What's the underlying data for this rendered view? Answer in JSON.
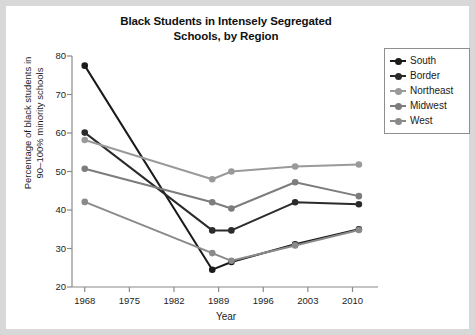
{
  "chart_data": {
    "type": "line",
    "title": "Black Students in Intensely Segregated Schools, by Region",
    "title_line1": "Black Students in Intensely Segregated",
    "title_line2": "Schools, by Region",
    "xlabel": "Year",
    "ylabel": "Percentage of black students in 90–100% minority schools",
    "ylabel_line1": "Percentage of black students in",
    "ylabel_line2": "90–100% minority schools",
    "xlim": [
      1966,
      2014
    ],
    "ylim": [
      20,
      80
    ],
    "yticks": [
      20,
      30,
      40,
      50,
      60,
      70,
      80
    ],
    "ytick_labels": [
      "20",
      "30",
      "40",
      "50",
      "60",
      "70",
      "80"
    ],
    "xticks": [
      1968,
      1975,
      1982,
      1989,
      1996,
      2003,
      2010
    ],
    "xtick_labels": [
      "1968",
      "1975",
      "1982",
      "1989",
      "1996",
      "2003",
      "2010"
    ],
    "grid": false,
    "legend_position": "outside top-right",
    "x": [
      1968,
      1988,
      1991,
      2001,
      2011
    ],
    "series": [
      {
        "name": "South",
        "color": "#1a1a1a",
        "values": [
          77.5,
          24.5,
          26.5,
          31.1,
          35.0
        ]
      },
      {
        "name": "Border",
        "color": "#2b2b2b",
        "values": [
          60.1,
          34.7,
          34.7,
          42.0,
          41.5
        ]
      },
      {
        "name": "Northeast",
        "color": "#9a9a9a",
        "values": [
          58.2,
          48.0,
          50.0,
          51.3,
          51.8
        ]
      },
      {
        "name": "Midwest",
        "color": "#7d7d7d",
        "values": [
          50.7,
          42.0,
          40.4,
          47.2,
          43.6
        ]
      },
      {
        "name": "West",
        "color": "#8a8a8a",
        "values": [
          42.1,
          28.8,
          26.8,
          30.8,
          34.8
        ]
      }
    ]
  },
  "legend": {
    "entries": [
      {
        "label": "South"
      },
      {
        "label": "Border"
      },
      {
        "label": "Northeast"
      },
      {
        "label": "Midwest"
      },
      {
        "label": "West"
      }
    ]
  }
}
